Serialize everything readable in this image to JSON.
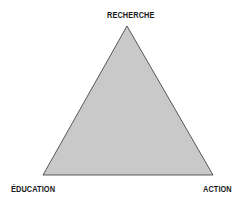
{
  "diagram": {
    "type": "triangle",
    "fill_color": "#c9c9c9",
    "stroke_color": "#333333",
    "vertices": {
      "top": "RECHERCHE",
      "bottom_left": "ÉDUCATION",
      "bottom_right": "ACTION"
    }
  }
}
